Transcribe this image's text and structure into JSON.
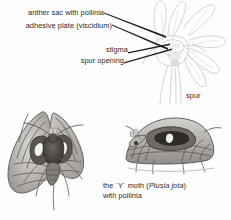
{
  "figure": {
    "type": "botanical-entomological-diagram",
    "background_color": "#fdfdfd",
    "ink_color": "#2a2a2a"
  },
  "labels": [
    {
      "id": "anther-sac",
      "text": "anther sac with pollinia"
    },
    {
      "id": "adhesive-plate",
      "text": "adhesive plate (viscidium)"
    },
    {
      "id": "stigma",
      "text": "stigma"
    },
    {
      "id": "spur-opening",
      "text": "spur opening"
    },
    {
      "id": "spur",
      "text": "spur"
    }
  ],
  "caption": {
    "line1_prefix": "the `Y` moth (",
    "line1_species": "Plusia jota",
    "line1_suffix": ")",
    "line2": "with pollinia"
  },
  "illustrations": [
    {
      "id": "orchid-flower",
      "description": "pale line drawing of orchid flower with column, stigma and long spur"
    },
    {
      "id": "moth-wings-spread",
      "description": "grayscale moth with wings spread, front view"
    },
    {
      "id": "moth-resting",
      "description": "grayscale moth at rest, side view, carrying pollinia"
    }
  ]
}
